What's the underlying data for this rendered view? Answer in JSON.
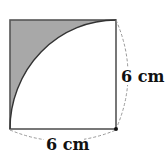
{
  "diagram": {
    "type": "geometry",
    "shape": "square with quarter-circle arc",
    "labels": {
      "right_side": "6 cm",
      "bottom_side": "6 cm"
    },
    "colors": {
      "shaded": "#a8a8a8",
      "outline": "#555555",
      "dashed": "#999999",
      "text": "#111111"
    }
  }
}
